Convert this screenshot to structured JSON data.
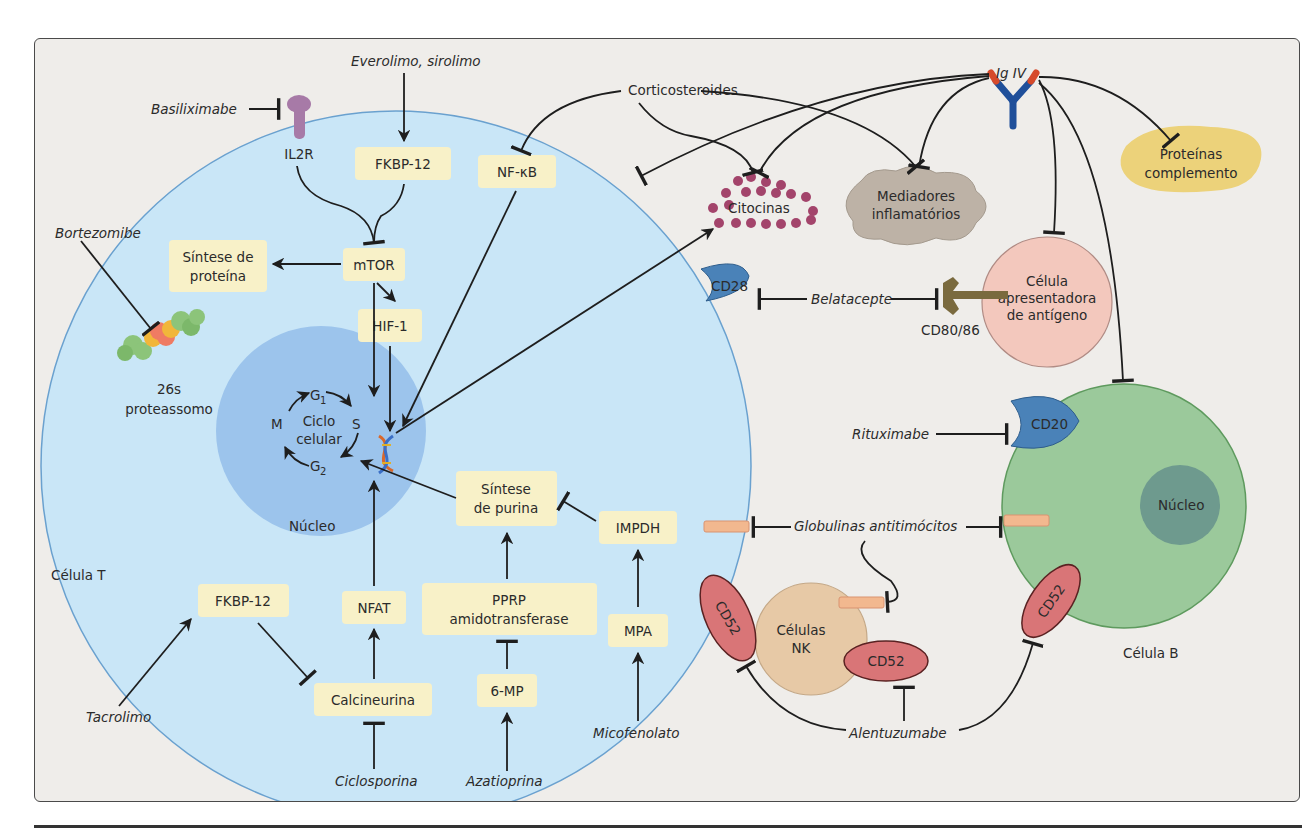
{
  "domain": "Diagram",
  "colors": {
    "background": "#efedea",
    "t_cell": "#c9e6f7",
    "t_cell_nucleus": "#9cc4ec",
    "b_cell": "#9bc99b",
    "b_cell_nucleus": "#6e9a8e",
    "apc": "#f3c8bd",
    "nk_cell": "#e7c9a6",
    "box": "#f8f1c8",
    "cd52": "#d97577",
    "cd28_cd20": "#4a82b8",
    "il2r": "#a77aa7",
    "cd80_86": "#7a6a3e",
    "cytokines": "#a3446b",
    "inflammatory_mediators": "#bdb2a6",
    "complement": "#ecd27a",
    "atg_marker": "#f2b88f",
    "ig_heavy": "#1f4f9a",
    "ig_tip": "#d64a2b"
  },
  "cells": {
    "t_cell": "Célula T",
    "t_nucleus": "Núcleo",
    "b_cell": "Célula B",
    "b_nucleus": "Núcleo",
    "apc_line1": "Célula",
    "apc_line2": "apresentadora",
    "apc_line3": "de antígeno",
    "nk_line1": "Células",
    "nk_line2": "NK"
  },
  "drugs": {
    "everolimo": "Everolimo, sirolimo",
    "basiliximabe": "Basiliximabe",
    "bortezomibe": "Bortezomibe",
    "corticosteroides": "Corticosteroides",
    "ig_iv": "Ig IV",
    "belatacepte": "Belatacepte",
    "rituximabe": "Rituximabe",
    "globulinas": "Globulinas antitimócitos",
    "tacrolimo": "Tacrolimo",
    "ciclosporina": "Ciclosporina",
    "azatioprina": "Azatioprina",
    "micofenolato": "Micofenolato",
    "alentuzumabe": "Alentuzumabe"
  },
  "molecules": {
    "il2r": "IL2R",
    "fkbp_top": "FKBP-12",
    "nfkb": "NF-κB",
    "mtor": "mTOR",
    "protein_synth_1": "Síntese de",
    "protein_synth_2": "proteína",
    "hif1": "HIF-1",
    "proteasome_1": "26s",
    "proteasome_2": "proteassomo",
    "cycle_g1": "G",
    "cycle_g1_sub": "1",
    "cycle_s": "S",
    "cycle_g2": "G",
    "cycle_g2_sub": "2",
    "cycle_m": "M",
    "cycle_label_1": "Ciclo",
    "cycle_label_2": "celular",
    "purine_1": "Síntese",
    "purine_2": "de purina",
    "impdh": "IMPDH",
    "pprp_1": "PPRP",
    "pprp_2": "amidotransferase",
    "mpa": "MPA",
    "six_mp": "6-MP",
    "fkbp_bottom": "FKBP-12",
    "nfat": "NFAT",
    "calcineurina": "Calcineurina",
    "cd28": "CD28",
    "cd80_86": "CD80/86",
    "cd20": "CD20",
    "cd52_t": "CD52",
    "cd52_nk": "CD52",
    "cd52_b": "CD52",
    "citocinas": "Citocinas",
    "mediadores_1": "Mediadores",
    "mediadores_2": "inflamatórios",
    "complemento_1": "Proteínas",
    "complemento_2": "complemento"
  }
}
